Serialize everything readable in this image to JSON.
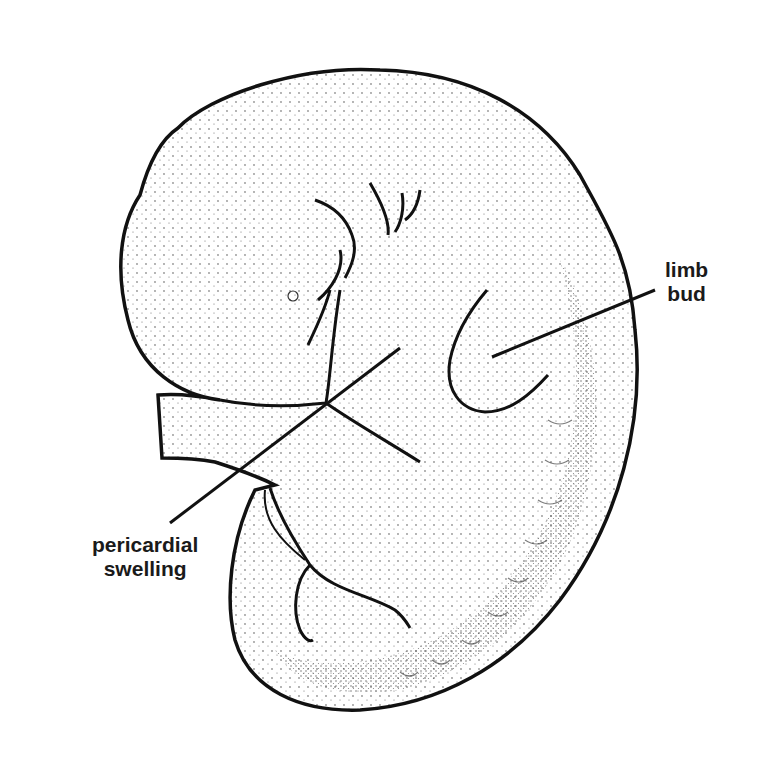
{
  "diagram": {
    "labels": [
      {
        "id": "limb-bud",
        "lines": [
          "limb",
          "bud"
        ]
      },
      {
        "id": "pericardial-swelling",
        "lines": [
          "pericardial",
          "swelling"
        ]
      }
    ],
    "colors": {
      "ink": "#1a1a1a",
      "background": "#ffffff"
    }
  }
}
